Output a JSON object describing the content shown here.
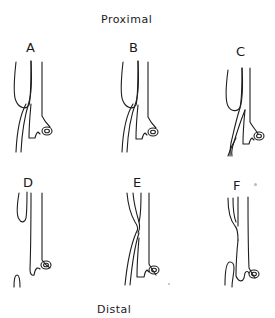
{
  "figure": {
    "top_label": "Proximal",
    "bottom_label": "Distal",
    "panels": [
      {
        "id": "A",
        "label": "A"
      },
      {
        "id": "B",
        "label": "B"
      },
      {
        "id": "C",
        "label": "C"
      },
      {
        "id": "D",
        "label": "D"
      },
      {
        "id": "E",
        "label": "E"
      },
      {
        "id": "F",
        "label": "F"
      }
    ]
  }
}
